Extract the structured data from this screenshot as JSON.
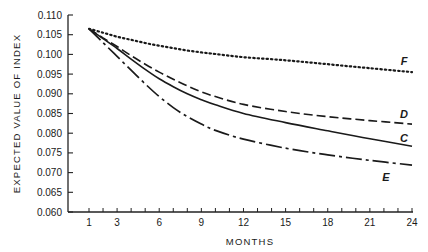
{
  "chart_data": {
    "type": "line",
    "title": "",
    "xlabel": "MONTHS",
    "ylabel": "EXPECTED VALUE OF INDEX",
    "xlim": [
      0,
      24
    ],
    "ylim": [
      0.06,
      0.11
    ],
    "grid": false,
    "legend": "inline labels at line ends",
    "x_ticks": [
      1,
      3,
      6,
      9,
      12,
      15,
      18,
      21,
      24
    ],
    "x_minor_ticks": [
      1,
      2,
      3,
      4,
      5,
      6,
      7,
      8,
      9,
      10,
      11,
      12,
      13,
      14,
      15,
      16,
      17,
      18,
      19,
      20,
      21,
      22,
      23,
      24
    ],
    "y_ticks": [
      "0.060",
      "0.065",
      "0.070",
      "0.075",
      "0.080",
      "0.085",
      "0.090",
      "0.095",
      "0.100",
      "0.105",
      "0.110"
    ],
    "x": [
      1,
      2,
      3,
      4,
      5,
      6,
      7,
      8,
      9,
      10,
      12,
      15,
      18,
      21,
      24
    ],
    "series": [
      {
        "name": "F",
        "style": "dotted",
        "values": [
          0.1065,
          0.1055,
          0.1045,
          0.1037,
          0.1029,
          0.1022,
          0.1016,
          0.101,
          0.1005,
          0.1001,
          0.0993,
          0.0985,
          0.0975,
          0.0965,
          0.0955
        ]
      },
      {
        "name": "D",
        "style": "dashed",
        "values": [
          0.1065,
          0.1042,
          0.102,
          0.0997,
          0.0975,
          0.0955,
          0.0937,
          0.092,
          0.0905,
          0.0893,
          0.0873,
          0.0855,
          0.0842,
          0.0832,
          0.0823
        ]
      },
      {
        "name": "C",
        "style": "solid",
        "values": [
          0.1065,
          0.104,
          0.1015,
          0.0988,
          0.0962,
          0.0938,
          0.0918,
          0.09,
          0.0885,
          0.0872,
          0.085,
          0.0827,
          0.0806,
          0.0786,
          0.0767
        ]
      },
      {
        "name": "E",
        "style": "dash-dot",
        "values": [
          0.1065,
          0.103,
          0.0995,
          0.096,
          0.0925,
          0.0893,
          0.0865,
          0.0842,
          0.0823,
          0.0807,
          0.0785,
          0.0762,
          0.0745,
          0.0731,
          0.0719
        ]
      }
    ]
  }
}
